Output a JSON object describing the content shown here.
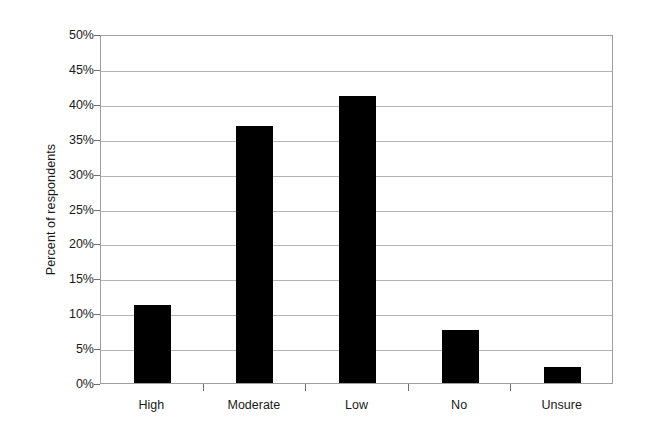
{
  "chart_data": {
    "type": "bar",
    "title": "",
    "subtitle": "",
    "xlabel": "",
    "ylabel": "Percent of respondents",
    "categories": [
      "High",
      "Moderate",
      "Low",
      "No",
      "Unsure"
    ],
    "values": [
      11.2,
      36.8,
      41.1,
      7.6,
      2.3
    ],
    "ylim": [
      0,
      50
    ],
    "ytick_values": [
      0,
      5,
      10,
      15,
      20,
      25,
      30,
      35,
      40,
      45,
      50
    ],
    "ytick_labels": [
      "0%",
      "5%",
      "10%",
      "15%",
      "20%",
      "25%",
      "30%",
      "35%",
      "40%",
      "45%",
      "50%"
    ],
    "grid": "horizontal",
    "legend": "none",
    "bar_color": "#000000",
    "gridline_color": "#b3b3b3",
    "axis_color": "#9e9e9e",
    "background_color": "#ffffff"
  }
}
